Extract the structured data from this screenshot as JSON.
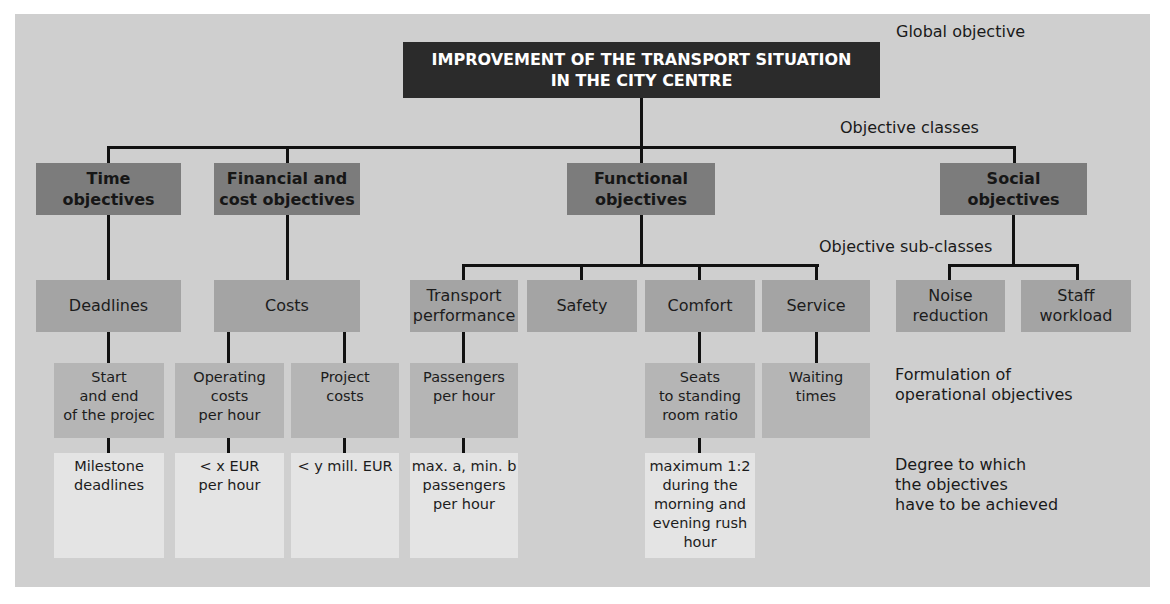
{
  "global_objective": "IMPROVEMENT OF THE TRANSPORT SITUATION\nIN THE CITY CENTRE",
  "level_labels": {
    "global": "Global objective",
    "classes": "Objective classes",
    "subclasses": "Objective sub-classes",
    "operational": "Formulation of\noperational objectives",
    "degree": "Degree to which\nthe objectives\nhave to be achieved"
  },
  "classes": [
    {
      "label": "Time\nobjectives"
    },
    {
      "label": "Financial and\ncost objectives"
    },
    {
      "label": "Functional\nobjectives"
    },
    {
      "label": "Social\nobjectives"
    }
  ],
  "subclasses": [
    {
      "label": "Deadlines"
    },
    {
      "label": "Costs"
    },
    {
      "label": "Transport\nperformance"
    },
    {
      "label": "Safety"
    },
    {
      "label": "Comfort"
    },
    {
      "label": "Service"
    },
    {
      "label": "Noise\nreduction"
    },
    {
      "label": "Staff\nworkload"
    }
  ],
  "operational": [
    {
      "label": "Start\nand end\nof the projec"
    },
    {
      "label": "Operating\ncosts\nper hour"
    },
    {
      "label": "Project\ncosts"
    },
    {
      "label": "Passengers\nper hour"
    },
    {
      "label": "Seats\nto standing\nroom ratio"
    },
    {
      "label": "Waiting\ntimes"
    }
  ],
  "degree": [
    {
      "label": "Milestone\ndeadlines"
    },
    {
      "label": "< x EUR\nper hour"
    },
    {
      "label": "< y mill. EUR"
    },
    {
      "label": "max. a, min. b\npassengers\nper hour"
    },
    {
      "label": "maximum 1:2\nduring the\nmorning and\nevening rush\nhour"
    }
  ]
}
